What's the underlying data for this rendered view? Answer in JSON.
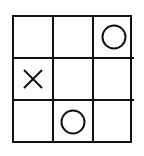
{
  "board": {
    "rows": 3,
    "cols": 3,
    "cells": [
      [
        "",
        "",
        "O"
      ],
      [
        "X",
        "",
        ""
      ],
      [
        "",
        "O",
        ""
      ]
    ]
  },
  "colors": {
    "line": "#111111",
    "mark": "#111111",
    "background": "#ffffff"
  }
}
